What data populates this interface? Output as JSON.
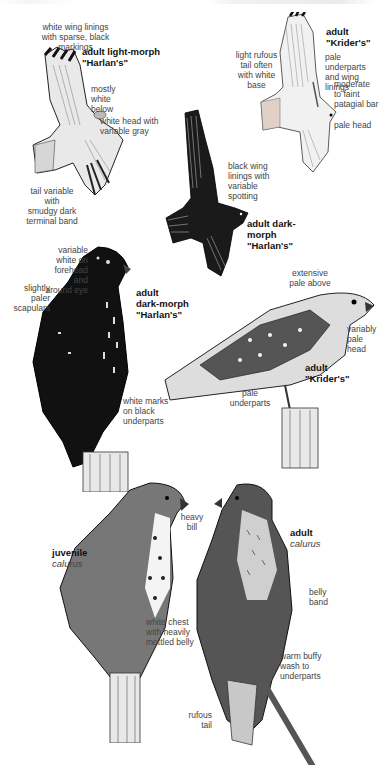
{
  "figures": [
    {
      "id": "light-harlans-flight",
      "title": "adult light-morph\n\"Harlan's\"",
      "labels": [
        "white wing linings\nwith sparse, black\nmarkings",
        "mostly\nwhite\nbelow",
        "white head with\nvariable gray",
        "tail variable with\nsmudgy dark\nterminal band"
      ]
    },
    {
      "id": "kriders-flight",
      "title": "adult\n\"Krider's\"",
      "labels": [
        "light rufous\ntail often\nwith white\nbase",
        "pale underparts\nand wing linings",
        "moderate\nto faint\npatagial bar",
        "pale head"
      ]
    },
    {
      "id": "dark-harlans-flight",
      "title": "adult dark-\nmorph\n\"Harlan's\"",
      "labels": [
        "black wing\nlinings with\nvariable\nspotting"
      ]
    },
    {
      "id": "dark-harlans-perched",
      "title": "adult\ndark-morph\n\"Harlan's\"",
      "labels": [
        "variable\nwhite on\nforehead and\naround eye",
        "slightly\npaler\nscapulars",
        "white marks\non black\nunderparts"
      ]
    },
    {
      "id": "kriders-perched",
      "title": "adult\n\"Krider's\"",
      "labels": [
        "extensive\npale above",
        "variably\npale\nhead",
        "pale\nunderparts"
      ]
    },
    {
      "id": "juvenile-calurus",
      "title": "juvenile",
      "subtitle": "calurus",
      "labels": [
        "heavy\nbill",
        "white chest\nwith heavily\nmottled belly"
      ]
    },
    {
      "id": "adult-calurus",
      "title": "adult",
      "subtitle": "calurus",
      "labels": [
        "belly\nband",
        "warm buffy\nwash to\nunderparts",
        "rufous\ntail"
      ]
    }
  ]
}
